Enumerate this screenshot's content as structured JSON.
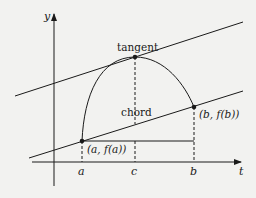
{
  "figure": {
    "type": "mean value theorem diagram",
    "axes": {
      "y_label": "y",
      "x_label": "t"
    },
    "tick_labels": {
      "a": "a",
      "c": "c",
      "b": "b"
    },
    "annotations": {
      "tangent": "tangent",
      "chord": "chord",
      "point_a": "(a, f(a))",
      "point_b": "(b, f(b))"
    },
    "colors": {
      "background": "#f2f2f0",
      "stroke": "#1a1a1a"
    }
  }
}
